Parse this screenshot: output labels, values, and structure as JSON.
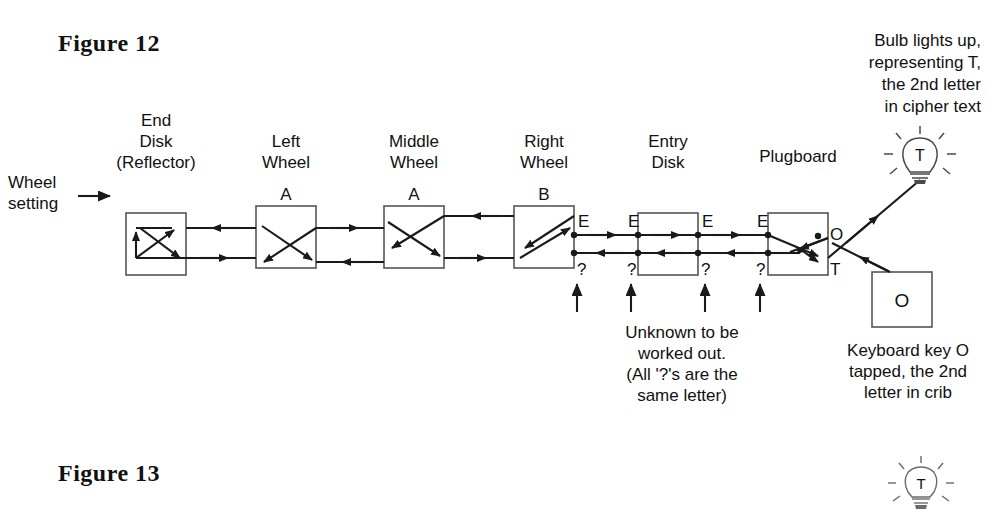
{
  "figure12": {
    "title": "Figure 12",
    "wheel_setting_label": "Wheel\nsetting",
    "bulb_caption": "Bulb lights up,\nrepresenting T,\nthe 2nd letter\nin cipher text",
    "unknown_caption": "Unknown to be\nworked out.\n(All '?'s are the\nsame letter)",
    "keyboard_caption": "Keyboard key O\ntapped, the 2nd\nletter in crib",
    "components": [
      {
        "name": "end-disk-reflector",
        "label": "End\nDisk\n(Reflector)",
        "setting": "",
        "label_x": 86,
        "box_x": 126
      },
      {
        "name": "left-wheel",
        "label": "Left\nWheel",
        "setting": "A",
        "label_x": 216,
        "box_x": 256
      },
      {
        "name": "middle-wheel",
        "label": "Middle\nWheel",
        "setting": "A",
        "label_x": 344,
        "box_x": 384
      },
      {
        "name": "right-wheel",
        "label": "Right\nWheel",
        "setting": "B",
        "label_x": 474,
        "box_x": 514
      },
      {
        "name": "entry-disk",
        "label": "Entry\nDisk",
        "setting": "",
        "label_x": 598,
        "box_x": 638
      },
      {
        "name": "plugboard",
        "label": "Plugboard",
        "setting": "",
        "label_x": 728,
        "box_x": 768
      }
    ],
    "line_labels": {
      "top": "E",
      "bottom": "?",
      "plug_top": "O",
      "plug_bottom": "T"
    },
    "top_letters": [
      "E",
      "E",
      "E",
      "E"
    ],
    "bottom_letters": [
      "?",
      "?",
      "?",
      "?"
    ],
    "bulb_letter": "T",
    "key_letter": "O"
  },
  "figure13": {
    "title": "Figure 13",
    "bulb_letter": "T"
  },
  "colors": {
    "ink": "#1a1a1a",
    "line": "#222222",
    "box_stroke": "#555555",
    "background": "#ffffff"
  }
}
